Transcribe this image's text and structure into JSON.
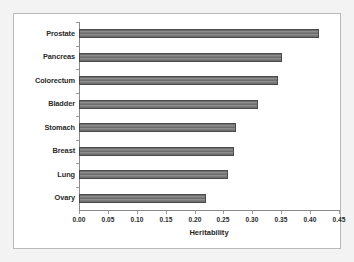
{
  "chart_data": {
    "type": "bar",
    "orientation": "horizontal",
    "title": "",
    "xlabel": "Heritability",
    "ylabel": "",
    "categories": [
      "Prostate",
      "Pancreas",
      "Colorectum",
      "Bladder",
      "Stomach",
      "Breast",
      "Lung",
      "Ovary"
    ],
    "values": [
      0.415,
      0.352,
      0.345,
      0.31,
      0.272,
      0.268,
      0.258,
      0.22
    ],
    "xlim": [
      0.0,
      0.45
    ],
    "xticks": [
      "0.00",
      "0.05",
      "0.10",
      "0.15",
      "0.20",
      "0.25",
      "0.30",
      "0.35",
      "0.40",
      "0.45"
    ],
    "xtick_values": [
      0.0,
      0.05,
      0.1,
      0.15,
      0.2,
      0.25,
      0.3,
      0.35,
      0.4,
      0.45
    ],
    "grid": false,
    "legend": null,
    "bar_color": "#7c7c7c",
    "bar_edge_color": "#4a4a4a",
    "axis_color": "#8a8a8a",
    "background_color": "#ffffff",
    "figure_background_color": "#f3f3f3"
  }
}
